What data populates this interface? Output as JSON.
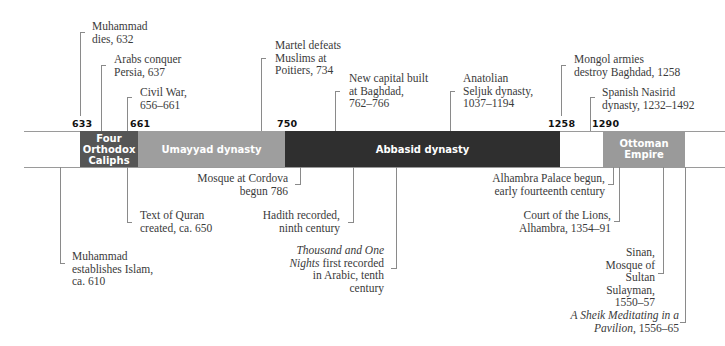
{
  "timeline": {
    "year_markers": [
      {
        "id": "y633",
        "label": "633"
      },
      {
        "id": "y661",
        "label": "661"
      },
      {
        "id": "y750",
        "label": "750"
      },
      {
        "id": "y1258",
        "label": "1258"
      },
      {
        "id": "y1290",
        "label": "1290"
      }
    ],
    "eras": [
      {
        "id": "orthodox",
        "lines": [
          "Four",
          "Orthodox",
          "Caliphs"
        ],
        "color": "#555555",
        "start": 633,
        "end": 661
      },
      {
        "id": "umayyad",
        "lines": [
          "Umayyad dynasty"
        ],
        "color": "#9e9e9e",
        "start": 661,
        "end": 750
      },
      {
        "id": "abbasid",
        "lines": [
          "Abbasid dynasty"
        ],
        "color": "#2f2f2f",
        "start": 750,
        "end": 1258
      },
      {
        "id": "ottoman",
        "lines": [
          "Ottoman",
          "Empire"
        ],
        "color": "#9a9a9a",
        "start": 1290,
        "end": null
      }
    ],
    "events_above": [
      {
        "id": "muhammad-dies",
        "lines": [
          "Muhammad",
          "dies, 632"
        ]
      },
      {
        "id": "arabs-conquer-persia",
        "lines": [
          "Arabs conquer",
          "Persia, 637"
        ]
      },
      {
        "id": "civil-war",
        "lines": [
          "Civil War,",
          "656–661"
        ]
      },
      {
        "id": "martel-defeats",
        "lines": [
          "Martel defeats",
          "Muslims at",
          "Poitiers, 734"
        ]
      },
      {
        "id": "baghdad-capital",
        "lines": [
          "New capital built",
          "at Baghdad,",
          "762–766"
        ]
      },
      {
        "id": "seljuk",
        "lines": [
          "Anatolian",
          "Seljuk dynasty,",
          "1037–1194"
        ]
      },
      {
        "id": "mongol",
        "lines": [
          "Mongol armies",
          "destroy Baghdad, 1258"
        ]
      },
      {
        "id": "nasirid",
        "lines": [
          "Spanish Nasirid",
          "dynasty, 1232–1492"
        ]
      }
    ],
    "events_below": [
      {
        "id": "establishes-islam",
        "lines": [
          "Muhammad",
          "establishes Islam,",
          "ca. 610"
        ]
      },
      {
        "id": "quran-text",
        "lines": [
          "Text of Quran",
          "created, ca. 650"
        ]
      },
      {
        "id": "cordova-mosque",
        "lines": [
          "Mosque at Cordova",
          "begun 786"
        ]
      },
      {
        "id": "hadith",
        "lines": [
          "Hadith recorded,",
          "ninth century"
        ]
      },
      {
        "id": "thousand-nights",
        "italic": "Thousand and One",
        "italic2": "Nights",
        "rest2": " first recorded",
        "lines": [
          "in Arabic, tenth",
          "century"
        ]
      },
      {
        "id": "alhambra-palace",
        "lines": [
          "Alhambra Palace begun,",
          "early fourteenth century"
        ]
      },
      {
        "id": "court-of-lions",
        "lines": [
          "Court of the Lions,",
          "Alhambra, 1354–91"
        ]
      },
      {
        "id": "sinan",
        "lines": [
          "Sinan,",
          "Mosque of",
          "Sultan",
          "Sulayman,",
          "1550–57"
        ]
      },
      {
        "id": "sheik",
        "italic": "A Sheik Meditating in a",
        "italic2": "Pavilion",
        "rest2": ", 1556–65",
        "lines": []
      }
    ]
  }
}
